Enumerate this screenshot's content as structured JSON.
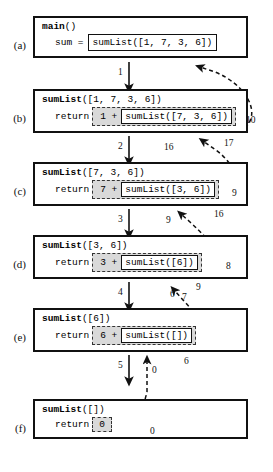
{
  "diagram": {
    "rows": [
      {
        "id": "a",
        "label": "(a)",
        "header_fn": "main",
        "header_args": "()",
        "stmt_keyword": "sum =",
        "kind": "assign",
        "call_text": "sumList([1, 7, 3, 6])"
      },
      {
        "id": "b",
        "label": "(b)",
        "header_fn": "sumList",
        "header_args": "([1, 7, 3, 6])",
        "stmt_keyword": "return",
        "kind": "sum",
        "operand": "1 +",
        "call_text": "sumList([7, 3, 6])"
      },
      {
        "id": "c",
        "label": "(c)",
        "header_fn": "sumList",
        "header_args": "([7, 3, 6])",
        "stmt_keyword": "return",
        "kind": "sum",
        "operand": "7 +",
        "call_text": "sumList([3, 6])"
      },
      {
        "id": "d",
        "label": "(d)",
        "header_fn": "sumList",
        "header_args": "([3, 6])",
        "stmt_keyword": "return",
        "kind": "sum",
        "operand": "3 +",
        "call_text": "sumList([6])"
      },
      {
        "id": "e",
        "label": "(e)",
        "header_fn": "sumList",
        "header_args": "([6])",
        "stmt_keyword": "return",
        "kind": "sum",
        "operand": "6 +",
        "call_text": "sumList([])"
      },
      {
        "id": "f",
        "label": "(f)",
        "header_fn": "sumList",
        "header_args": "([])",
        "stmt_keyword": "return",
        "kind": "value",
        "value_text": "0"
      }
    ],
    "call_edges": [
      {
        "from": "a",
        "to": "b",
        "step": "1"
      },
      {
        "from": "b",
        "to": "c",
        "step": "2"
      },
      {
        "from": "c",
        "to": "d",
        "step": "3"
      },
      {
        "from": "d",
        "to": "e",
        "step": "4"
      },
      {
        "from": "e",
        "to": "f",
        "step": "5"
      }
    ],
    "return_edges": [
      {
        "from": "f",
        "to": "e",
        "value": "0",
        "result": "0"
      },
      {
        "from": "e",
        "to": "d",
        "value": "6",
        "result": "7"
      },
      {
        "from": "d",
        "to": "c",
        "value": "9",
        "result": "8"
      },
      {
        "from": "c",
        "to": "b",
        "value": "16",
        "result": "9"
      },
      {
        "from": "b",
        "to": "a",
        "value": "17",
        "result": "10"
      }
    ]
  }
}
